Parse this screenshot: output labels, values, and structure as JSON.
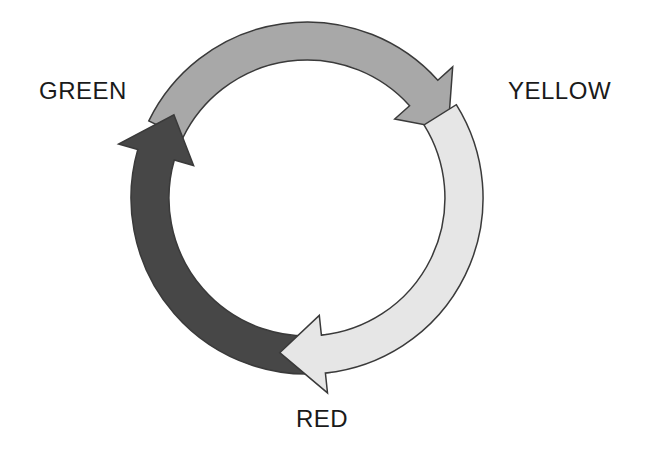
{
  "diagram": {
    "type": "cycle",
    "labels": {
      "green": "GREEN",
      "yellow": "YELLOW",
      "red": "RED"
    },
    "center": [
      307,
      198
    ],
    "outer_radius": 176,
    "inner_radius": 138,
    "outline_color": "#3a3a3a",
    "arrows": [
      {
        "name": "arrow-green-to-yellow",
        "from": "GREEN",
        "to": "YELLOW",
        "fill": "#a8a8a8",
        "start_deg": 206,
        "head_base_deg": 318,
        "tip_deg": 334
      },
      {
        "name": "arrow-red-to-green",
        "from": "RED",
        "to": "GREEN",
        "fill": "#474747",
        "start_deg": 82,
        "head_base_deg": 196,
        "tip_deg": 212
      },
      {
        "name": "arrow-yellow-to-red",
        "from": "YELLOW",
        "to": "RED",
        "fill": "#e6e6e6",
        "start_deg": 328,
        "head_base_deg": 84,
        "tip_deg": 100
      }
    ]
  }
}
